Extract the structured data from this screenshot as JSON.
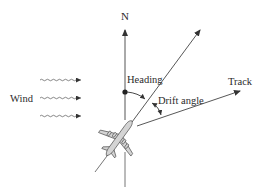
{
  "diagram": {
    "labels": {
      "north": "N",
      "heading": "Heading",
      "track": "Track",
      "drift_angle": "Drift angle",
      "wind": "Wind"
    },
    "elements": {
      "north_line": {
        "from": [
          125,
          187
        ],
        "to": [
          125,
          28
        ]
      },
      "heading_line": {
        "from": [
          95,
          172
        ],
        "to": [
          201,
          29
        ]
      },
      "track_line": {
        "from": [
          137,
          126
        ],
        "to": [
          241,
          91
        ]
      },
      "wind_arrows": [
        {
          "y": 80,
          "x_start": 40,
          "x_end": 81
        },
        {
          "y": 98,
          "x_start": 40,
          "x_end": 81
        },
        {
          "y": 116,
          "x_start": 40,
          "x_end": 81
        }
      ],
      "heading_origin_dot": [
        125,
        92
      ]
    },
    "colors": {
      "line": "#444444",
      "airplane_fill": "#d4d4d4",
      "airplane_stroke": "#555555",
      "background": "#ffffff"
    }
  }
}
